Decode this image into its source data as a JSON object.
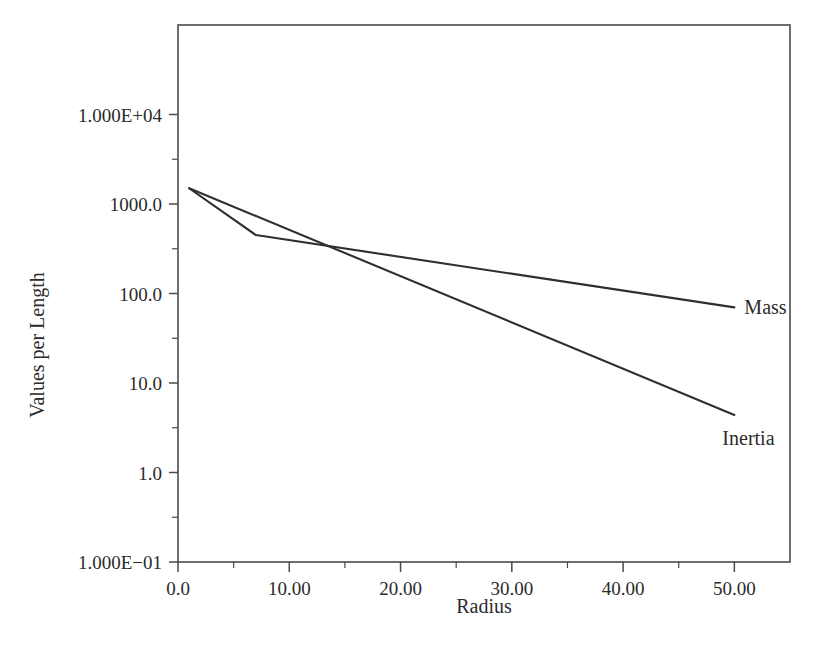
{
  "chart_data": {
    "type": "line",
    "title": "",
    "xlabel": "Radius",
    "ylabel": "Values per Length",
    "xlim": [
      0,
      55
    ],
    "ylim": [
      0.1,
      100000
    ],
    "yscale": "log",
    "xscale": "linear",
    "grid": false,
    "legend_position": "inline-at-line-end",
    "x_tick_labels": [
      "0.0",
      "10.00",
      "20.00",
      "30.00",
      "40.00",
      "50.00"
    ],
    "x_tick_values": [
      0,
      10,
      20,
      30,
      40,
      50
    ],
    "x_minor_tick_values": [
      5,
      15,
      25,
      35,
      45
    ],
    "y_tick_labels": [
      "1.000E+04",
      "1000.0",
      "100.0",
      "10.0",
      "1.0",
      "1.000E-01"
    ],
    "y_tick_values": [
      10000,
      1000,
      100,
      10,
      1,
      0.1
    ],
    "series": [
      {
        "name": "Mass",
        "label": "Mass",
        "x": [
          1,
          7,
          50
        ],
        "values": [
          1500,
          450,
          70
        ]
      },
      {
        "name": "Inertia",
        "label": "Inertia",
        "x": [
          1,
          50
        ],
        "values": [
          1500,
          4.4
        ]
      }
    ],
    "colors": {
      "series_line": "#2f2f2f",
      "axis": "#4a4a4a",
      "text": "#2b2b2b",
      "background": "#ffffff"
    }
  }
}
